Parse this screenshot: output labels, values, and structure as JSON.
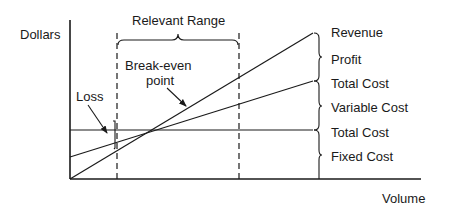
{
  "axes": {
    "y_label": "Dollars",
    "x_label": "Volume"
  },
  "range": {
    "label": "Relevant Range"
  },
  "annotations": {
    "break_even_line1": "Break-even",
    "break_even_line2": "point",
    "loss": "Loss"
  },
  "right_labels": {
    "revenue": "Revenue",
    "profit": "Profit",
    "total_cost_top": "Total Cost",
    "variable_cost": "Variable Cost",
    "total_cost_bottom": "Total Cost",
    "fixed_cost": "Fixed Cost"
  }
}
